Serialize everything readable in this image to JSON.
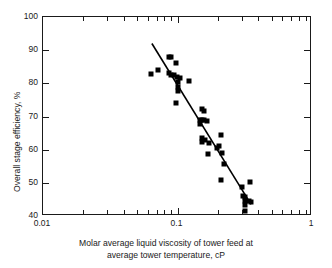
{
  "chart_data": {
    "type": "scatter",
    "title": "",
    "xlabel": "Molar average liquid viscosity of tower feed at average tower temperature, cP",
    "xlabel_lines": [
      "Molar average liquid viscosity of tower feed at",
      "average tower temperature, cP"
    ],
    "ylabel": "Overall stage efficiency, %",
    "xscale": "log",
    "yscale": "linear",
    "xlim": [
      0.01,
      1
    ],
    "ylim": [
      40,
      100
    ],
    "grid": false,
    "legend": null,
    "x_tick_labels": [
      "0.01",
      "0.1",
      "1"
    ],
    "x_tick_values": [
      0.01,
      0.1,
      1
    ],
    "x_minor_ticks": [
      0.02,
      0.03,
      0.04,
      0.05,
      0.06,
      0.07,
      0.08,
      0.09,
      0.2,
      0.3,
      0.4,
      0.5,
      0.6,
      0.7,
      0.8,
      0.9
    ],
    "y_tick_labels": [
      "40",
      "50",
      "60",
      "70",
      "80",
      "90",
      "100"
    ],
    "y_tick_values": [
      40,
      50,
      60,
      70,
      80,
      90,
      100
    ],
    "marker_shape": "square",
    "marker_color": "#000000",
    "points": [
      {
        "x": 0.064,
        "y": 82.8
      },
      {
        "x": 0.072,
        "y": 84.0
      },
      {
        "x": 0.086,
        "y": 88.0
      },
      {
        "x": 0.09,
        "y": 87.8
      },
      {
        "x": 0.098,
        "y": 86.0
      },
      {
        "x": 0.086,
        "y": 83.0
      },
      {
        "x": 0.09,
        "y": 82.6
      },
      {
        "x": 0.094,
        "y": 82.4
      },
      {
        "x": 0.099,
        "y": 82.0
      },
      {
        "x": 0.104,
        "y": 81.5
      },
      {
        "x": 0.1,
        "y": 80.4
      },
      {
        "x": 0.122,
        "y": 80.6
      },
      {
        "x": 0.1,
        "y": 79.0
      },
      {
        "x": 0.101,
        "y": 77.8
      },
      {
        "x": 0.098,
        "y": 74.2
      },
      {
        "x": 0.152,
        "y": 72.4
      },
      {
        "x": 0.158,
        "y": 71.8
      },
      {
        "x": 0.147,
        "y": 69.0
      },
      {
        "x": 0.152,
        "y": 68.8
      },
      {
        "x": 0.158,
        "y": 68.9
      },
      {
        "x": 0.165,
        "y": 68.6
      },
      {
        "x": 0.148,
        "y": 67.6
      },
      {
        "x": 0.21,
        "y": 64.4
      },
      {
        "x": 0.152,
        "y": 63.6
      },
      {
        "x": 0.16,
        "y": 62.8
      },
      {
        "x": 0.152,
        "y": 62.2
      },
      {
        "x": 0.172,
        "y": 62.0
      },
      {
        "x": 0.205,
        "y": 61.0
      },
      {
        "x": 0.196,
        "y": 60.4
      },
      {
        "x": 0.215,
        "y": 59.0
      },
      {
        "x": 0.168,
        "y": 58.6
      },
      {
        "x": 0.22,
        "y": 55.6
      },
      {
        "x": 0.212,
        "y": 51.0
      },
      {
        "x": 0.345,
        "y": 50.2
      },
      {
        "x": 0.3,
        "y": 48.8
      },
      {
        "x": 0.305,
        "y": 46.0
      },
      {
        "x": 0.318,
        "y": 45.8
      },
      {
        "x": 0.32,
        "y": 44.6
      },
      {
        "x": 0.338,
        "y": 44.4
      },
      {
        "x": 0.35,
        "y": 44.2
      },
      {
        "x": 0.32,
        "y": 43.2
      },
      {
        "x": 0.318,
        "y": 41.6
      }
    ],
    "trend_line": {
      "type": "line",
      "points": [
        {
          "x": 0.0645,
          "y": 92.0
        },
        {
          "x": 0.352,
          "y": 43.5
        }
      ],
      "color": "#000000",
      "width": 1.6
    }
  }
}
